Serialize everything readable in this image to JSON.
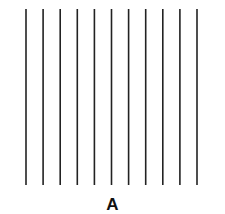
{
  "figure": {
    "line_count": 11,
    "line_color": "#222222",
    "caption": "A"
  }
}
